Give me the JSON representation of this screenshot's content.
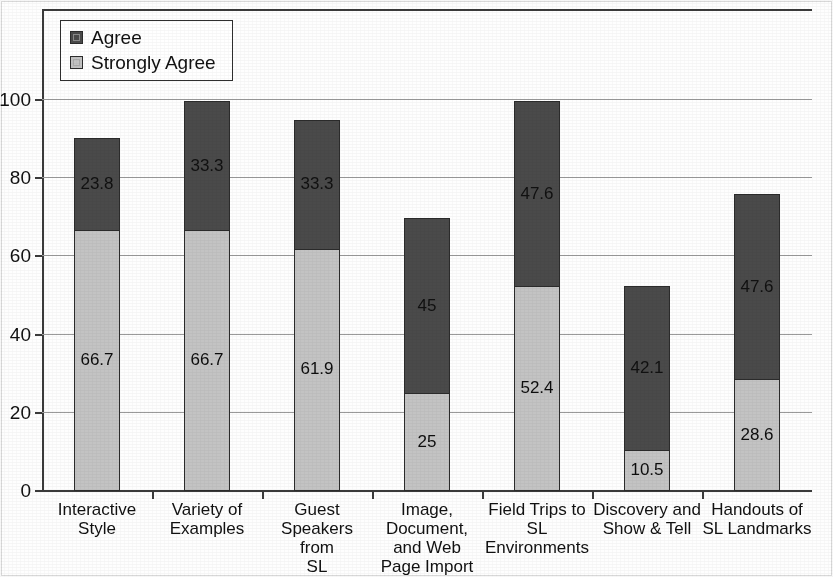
{
  "legend": {
    "position": "top-left-inside",
    "items": [
      {
        "label": "Agree",
        "color": "#4a4a4a",
        "icon": "legend-swatch-icon"
      },
      {
        "label": "Strongly Agree",
        "color": "#c3c3c3",
        "icon": "legend-swatch-icon"
      }
    ]
  },
  "axes": {
    "y_ticks": [
      "0",
      "20",
      "40",
      "60",
      "80",
      "100"
    ],
    "y_min": 0,
    "y_max": 100
  },
  "chart_data": {
    "type": "bar",
    "subtype": "stacked-vertical",
    "title": "",
    "subtitle": "",
    "xlabel": "",
    "ylabel": "",
    "ylim": [
      0,
      100
    ],
    "yticks": [
      0,
      20,
      40,
      60,
      80,
      100
    ],
    "grid": true,
    "legend_position": "top-left-inside",
    "categories": [
      "Interactive Style",
      "Variety of Examples",
      "Guest Speakers from SL",
      "Image, Document, and Web Page Import",
      "Field Trips to SL Environments",
      "Discovery and Show & Tell",
      "Handouts of SL Landmarks"
    ],
    "category_lines": [
      [
        "Interactive",
        "Style"
      ],
      [
        "Variety of",
        "Examples"
      ],
      [
        "Guest",
        "Speakers from",
        "SL"
      ],
      [
        "Image,",
        "Document,",
        "and Web",
        "Page Import"
      ],
      [
        "Field Trips to",
        "SL",
        "Environments"
      ],
      [
        "Discovery and",
        "Show & Tell"
      ],
      [
        "Handouts of",
        "SL Landmarks"
      ]
    ],
    "series": [
      {
        "name": "Strongly Agree",
        "color": "#c3c3c3",
        "values": [
          66.7,
          66.7,
          61.9,
          25,
          52.4,
          10.5,
          28.6
        ],
        "labels": [
          "66.7",
          "66.7",
          "61.9",
          "25",
          "52.4",
          "10.5",
          "28.6"
        ]
      },
      {
        "name": "Agree",
        "color": "#4a4a4a",
        "values": [
          23.8,
          33.3,
          33.3,
          45,
          47.6,
          42.1,
          47.6
        ],
        "labels": [
          "23.8",
          "33.3",
          "33.3",
          "45",
          "47.6",
          "42.1",
          "47.6"
        ]
      }
    ],
    "totals": [
      90.5,
      100,
      95.2,
      70,
      100,
      52.6,
      76.2
    ]
  }
}
